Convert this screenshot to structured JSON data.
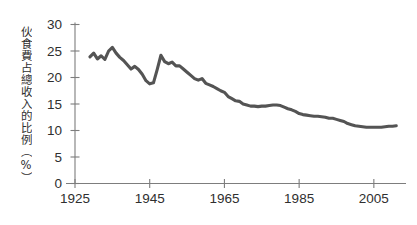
{
  "chart_data": {
    "type": "line",
    "title": "",
    "xlabel": "",
    "ylabel": "伙食費占總收入的比例（%）",
    "ylabel_plain": "Food expenditure as a share of total income (%)",
    "xlim": [
      1925,
      2012
    ],
    "ylim": [
      0,
      30
    ],
    "grid": false,
    "legend": "none",
    "x_tick_labels": [
      "1925",
      "1945",
      "1965",
      "1985",
      "2005"
    ],
    "x_ticks": [
      1925,
      1945,
      1965,
      1985,
      2005
    ],
    "y_tick_labels": [
      "0",
      "5",
      "10",
      "15",
      "20",
      "25",
      "30"
    ],
    "y_ticks": [
      0,
      5,
      10,
      15,
      20,
      25,
      30
    ],
    "line_color": "#545454",
    "axis_color": "#7d7d7d",
    "series": [
      {
        "name": "伙食費占總收入的比例",
        "x": [
          1929,
          1930,
          1931,
          1932,
          1933,
          1934,
          1935,
          1936,
          1937,
          1938,
          1939,
          1940,
          1941,
          1942,
          1943,
          1944,
          1945,
          1946,
          1947,
          1948,
          1949,
          1950,
          1951,
          1952,
          1953,
          1954,
          1955,
          1956,
          1957,
          1958,
          1959,
          1960,
          1961,
          1962,
          1963,
          1964,
          1965,
          1966,
          1967,
          1968,
          1969,
          1970,
          1971,
          1972,
          1973,
          1974,
          1975,
          1976,
          1977,
          1978,
          1979,
          1980,
          1981,
          1982,
          1983,
          1984,
          1985,
          1986,
          1987,
          1988,
          1989,
          1990,
          1991,
          1992,
          1993,
          1994,
          1995,
          1996,
          1997,
          1998,
          1999,
          2000,
          2001,
          2002,
          2003,
          2004,
          2005,
          2006,
          2007,
          2008,
          2009,
          2010,
          2011
        ],
        "values": [
          23.9,
          24.6,
          23.5,
          24.1,
          23.4,
          25.0,
          25.7,
          24.6,
          23.8,
          23.2,
          22.4,
          21.6,
          22.1,
          21.5,
          20.6,
          19.4,
          18.8,
          19.0,
          21.5,
          24.2,
          23.0,
          22.6,
          22.9,
          22.2,
          22.2,
          21.6,
          21.0,
          20.4,
          19.8,
          19.5,
          19.8,
          18.9,
          18.6,
          18.3,
          17.9,
          17.5,
          17.2,
          16.4,
          16.0,
          15.6,
          15.5,
          15.0,
          14.8,
          14.6,
          14.6,
          14.5,
          14.6,
          14.6,
          14.7,
          14.8,
          14.8,
          14.7,
          14.4,
          14.1,
          13.9,
          13.6,
          13.2,
          13.0,
          12.9,
          12.8,
          12.7,
          12.7,
          12.6,
          12.5,
          12.3,
          12.3,
          12.1,
          11.9,
          11.7,
          11.3,
          11.1,
          10.9,
          10.8,
          10.7,
          10.6,
          10.6,
          10.6,
          10.6,
          10.6,
          10.7,
          10.8,
          10.8,
          10.9
        ]
      }
    ]
  }
}
